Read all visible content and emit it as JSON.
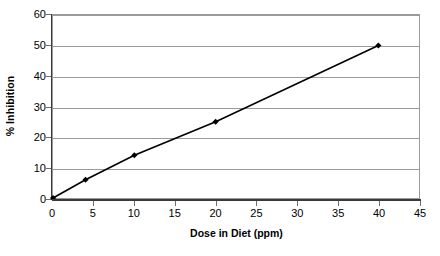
{
  "chart_data": {
    "type": "line",
    "title": "",
    "subtitle": "",
    "xlabel": "Dose in Diet (ppm)",
    "ylabel": "% Inhibition",
    "xlim": [
      0,
      45
    ],
    "ylim": [
      0,
      60
    ],
    "xticks": [
      0,
      5,
      10,
      15,
      20,
      25,
      30,
      35,
      40,
      45
    ],
    "xtick_labels": [
      "0",
      "5",
      "10",
      "15",
      "20",
      "25",
      "30",
      "35",
      "40",
      "45"
    ],
    "yticks": [
      0,
      10,
      20,
      30,
      40,
      50,
      60
    ],
    "ytick_labels": [
      "0",
      "10",
      "20",
      "30",
      "40",
      "50",
      "60"
    ],
    "grid": "horizontal",
    "legend": "none",
    "x": [
      0,
      4,
      10,
      20,
      40
    ],
    "values": [
      0,
      6,
      14,
      25,
      50
    ],
    "series": [
      {
        "name": "% Inhibition",
        "x": [
          0,
          4,
          10,
          20,
          40
        ],
        "values": [
          0,
          6,
          14,
          25,
          50
        ],
        "line_color": "#000000",
        "marker": "diamond",
        "marker_color": "#000000"
      }
    ],
    "points": [
      {
        "x": 0,
        "y": 0
      },
      {
        "x": 4,
        "y": 6
      },
      {
        "x": 10,
        "y": 14
      },
      {
        "x": 20,
        "y": 25
      },
      {
        "x": 40,
        "y": 50
      }
    ],
    "colors": {
      "background": "#ffffff",
      "plot_border": "#9a9a9a",
      "gridline": "#9a9a9a",
      "axis": "#3a3a3a",
      "series": "#000000",
      "text": "#000000"
    }
  }
}
